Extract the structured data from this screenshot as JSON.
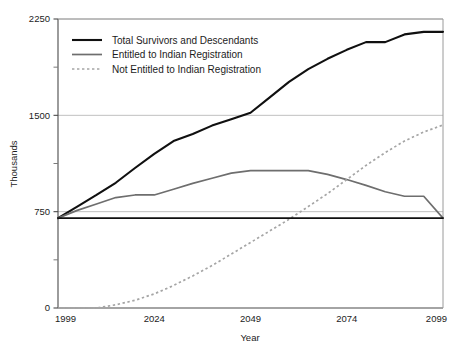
{
  "chart_data": {
    "type": "line",
    "title": "",
    "xlabel": "Year",
    "ylabel": "Thousands",
    "xlim": [
      1999,
      2099
    ],
    "ylim": [
      0,
      2250
    ],
    "xticks": [
      1999,
      2024,
      2049,
      2074,
      2099
    ],
    "xtick_labels": [
      "1999",
      "2024",
      "2049",
      "2074",
      "2099"
    ],
    "yticks": [
      0,
      750,
      1500,
      2250
    ],
    "ytick_labels": [
      "0",
      "750",
      "1500",
      "2250"
    ],
    "yminor_ticks": [
      375,
      1125,
      1875
    ],
    "grid": "horizontal-major-only",
    "legend_position": "upper-left-inside",
    "series": [
      {
        "name": "Total Survivors and Descendants",
        "style": "solid",
        "color": "#101010",
        "width": 2.1,
        "x": [
          1999,
          2004,
          2009,
          2014,
          2019,
          2024,
          2029,
          2034,
          2039,
          2044,
          2049,
          2054,
          2059,
          2064,
          2069,
          2074,
          2079,
          2084,
          2089,
          2094,
          2099
        ],
        "y": [
          700,
          790,
          880,
          975,
          1090,
          1200,
          1300,
          1355,
          1420,
          1470,
          1520,
          1640,
          1760,
          1860,
          1940,
          2010,
          2070,
          2070,
          2130,
          2150,
          2150
        ]
      },
      {
        "name": "Entitled to Indian Registration",
        "style": "solid",
        "color": "#6e6e6e",
        "width": 1.7,
        "x": [
          1999,
          2004,
          2009,
          2014,
          2019,
          2024,
          2029,
          2034,
          2039,
          2044,
          2049,
          2054,
          2059,
          2064,
          2069,
          2074,
          2079,
          2084,
          2089,
          2094,
          2099
        ],
        "y": [
          700,
          760,
          810,
          860,
          880,
          880,
          925,
          970,
          1010,
          1050,
          1070,
          1070,
          1070,
          1070,
          1040,
          1000,
          955,
          905,
          870,
          870,
          700
        ]
      },
      {
        "name": "Not Entitled to Indian Registration",
        "style": "dotted",
        "color": "#a5a5a5",
        "width": 1.7,
        "x": [
          1999,
          2004,
          2009,
          2014,
          2019,
          2024,
          2029,
          2034,
          2039,
          2044,
          2049,
          2054,
          2059,
          2064,
          2069,
          2074,
          2079,
          2084,
          2089,
          2094,
          2099
        ],
        "y": [
          0,
          0,
          0,
          25,
          60,
          110,
          175,
          250,
          330,
          420,
          510,
          600,
          690,
          790,
          890,
          1000,
          1110,
          1210,
          1300,
          1370,
          1425
        ]
      },
      {
        "name": "Baseline Reference",
        "style": "solid",
        "color": "#101010",
        "width": 1.8,
        "x": [
          1999,
          2099
        ],
        "y": [
          700,
          700
        ]
      }
    ]
  },
  "legend": {
    "entries": [
      {
        "label": "Total Survivors and Descendants",
        "color": "#101010",
        "style": "solid"
      },
      {
        "label": "Entitled to Indian Registration",
        "color": "#6e6e6e",
        "style": "solid"
      },
      {
        "label": "Not Entitled to Indian Registration",
        "color": "#a5a5a5",
        "style": "dotted"
      }
    ]
  }
}
